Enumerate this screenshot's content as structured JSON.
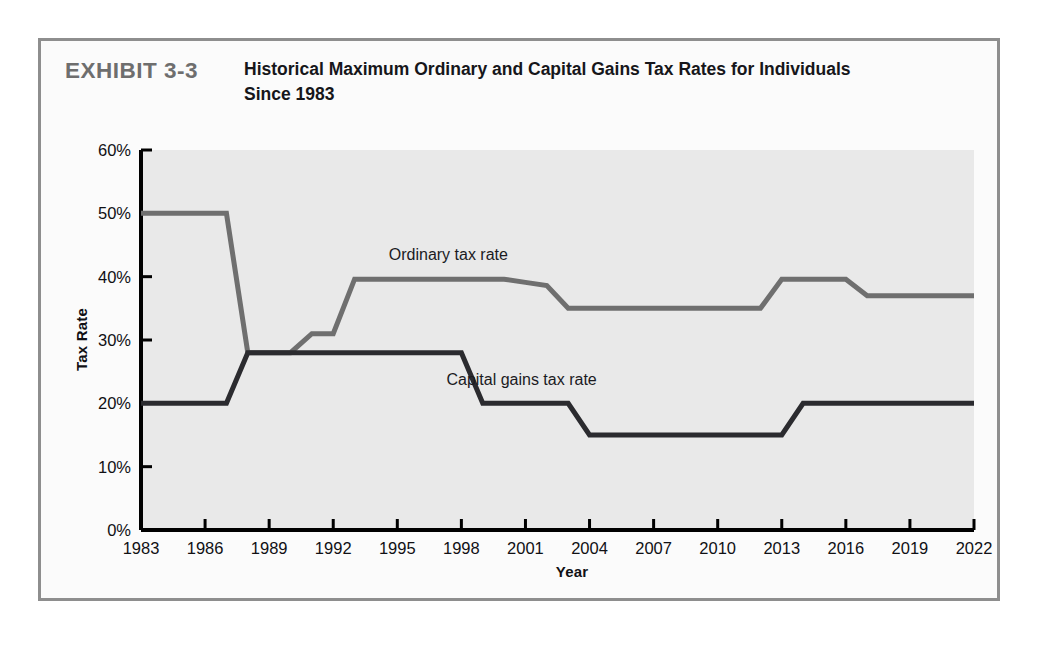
{
  "exhibit": {
    "number": "EXHIBIT 3-3",
    "title": "Historical Maximum Ordinary and Capital Gains Tax Rates for Individuals Since 1983"
  },
  "chart_data": {
    "type": "line",
    "title": "Historical Maximum Ordinary and Capital Gains Tax Rates for Individuals Since 1983",
    "xlabel": "Year",
    "ylabel": "Tax Rate",
    "xlim": [
      1983,
      2022
    ],
    "ylim": [
      0,
      60
    ],
    "ytick_labels": [
      "0%",
      "10%",
      "20%",
      "30%",
      "40%",
      "50%",
      "60%"
    ],
    "ytick_values": [
      0,
      10,
      20,
      30,
      40,
      50,
      60
    ],
    "xtick_labels": [
      "1983",
      "1986",
      "1989",
      "1992",
      "1995",
      "1998",
      "2001",
      "2004",
      "2007",
      "2010",
      "2013",
      "2016",
      "2019",
      "2022"
    ],
    "xtick_values": [
      1983,
      1986,
      1989,
      1992,
      1995,
      1998,
      2001,
      2004,
      2007,
      2010,
      2013,
      2016,
      2019,
      2022
    ],
    "grid": false,
    "legend": "inline-annotations",
    "series": [
      {
        "name": "Ordinary tax rate",
        "color": "#6f6f6f",
        "label_x": 1994.6,
        "label_y": 43.2,
        "x": [
          1983,
          1984,
          1985,
          1986,
          1987,
          1988,
          1989,
          1990,
          1991,
          1992,
          1993,
          1994,
          1995,
          1996,
          1997,
          1998,
          1999,
          2000,
          2001,
          2002,
          2003,
          2004,
          2005,
          2006,
          2007,
          2008,
          2009,
          2010,
          2011,
          2012,
          2013,
          2014,
          2015,
          2016,
          2017,
          2018,
          2019,
          2020,
          2021,
          2022
        ],
        "y": [
          50,
          50,
          50,
          50,
          50,
          28,
          28,
          28,
          31,
          31,
          39.6,
          39.6,
          39.6,
          39.6,
          39.6,
          39.6,
          39.6,
          39.6,
          39.1,
          38.6,
          35,
          35,
          35,
          35,
          35,
          35,
          35,
          35,
          35,
          35,
          39.6,
          39.6,
          39.6,
          39.6,
          37,
          37,
          37,
          37,
          37,
          37
        ]
      },
      {
        "name": "Capital gains tax rate",
        "color": "#2b2b2f",
        "label_x": 1997.3,
        "label_y": 23.6,
        "x": [
          1983,
          1984,
          1985,
          1986,
          1987,
          1988,
          1989,
          1990,
          1991,
          1992,
          1993,
          1994,
          1995,
          1996,
          1997,
          1998,
          1999,
          2000,
          2001,
          2002,
          2003,
          2004,
          2005,
          2006,
          2007,
          2008,
          2009,
          2010,
          2011,
          2012,
          2013,
          2014,
          2015,
          2016,
          2017,
          2018,
          2019,
          2020,
          2021,
          2022
        ],
        "y": [
          20,
          20,
          20,
          20,
          20,
          28,
          28,
          28,
          28,
          28,
          28,
          28,
          28,
          28,
          28,
          28,
          20,
          20,
          20,
          20,
          20,
          15,
          15,
          15,
          15,
          15,
          15,
          15,
          15,
          15,
          15,
          20,
          20,
          20,
          20,
          20,
          20,
          20,
          20,
          20
        ]
      }
    ]
  },
  "style": {
    "plot_background": "#e9e9e9",
    "axis_color": "#000000",
    "frame_color": "#8e8e8e",
    "exhibit_number_color": "#6e6e6e",
    "page_background": "#ffffff"
  }
}
